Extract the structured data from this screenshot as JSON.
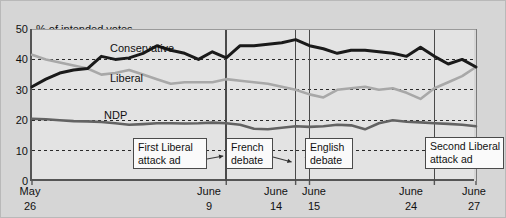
{
  "figure": {
    "axis_title": "% of intended votes",
    "background_color": "#d6d6d6",
    "plot_background_color": "#e3e3e3",
    "axis_color": "#555555"
  },
  "y_axis": {
    "ticks": [
      "50",
      "40",
      "30",
      "20",
      "10",
      "0"
    ],
    "min": 0,
    "max": 50,
    "gridline_style": "dashed"
  },
  "x_axis": {
    "ticks": [
      {
        "month": "May",
        "day": "26"
      },
      {
        "month": "June",
        "day": "9"
      },
      {
        "month": "June",
        "day": "14"
      },
      {
        "month": "June",
        "day": "15"
      },
      {
        "month": "June",
        "day": "24"
      },
      {
        "month": "June",
        "day": "27"
      }
    ]
  },
  "series_labels": {
    "conservative": "Conservative",
    "liberal": "Liberal",
    "ndp": "NDP"
  },
  "annotations": [
    {
      "id": "first-liberal-attack-ad",
      "line1": "First Liberal",
      "line2": "attack ad"
    },
    {
      "id": "french-debate",
      "line1": "French",
      "line2": "debate"
    },
    {
      "id": "english-debate",
      "line1": "English",
      "line2": "debate"
    },
    {
      "id": "second-liberal-attack-ad",
      "line1": "Second Liberal",
      "line2": "attack ad"
    }
  ],
  "chart_data": {
    "type": "line",
    "title": "% of intended votes",
    "xlabel": "",
    "ylabel": "% of intended votes",
    "ylim": [
      0,
      50
    ],
    "yticks": [
      0,
      10,
      20,
      30,
      40,
      50
    ],
    "grid": "horizontal-dashed",
    "legend": "inline-series-labels",
    "x_tick_labels": [
      "May 26",
      "June 9",
      "June 14",
      "June 15",
      "June 24",
      "June 27"
    ],
    "x_tick_days": [
      0,
      14,
      19,
      20,
      29,
      32
    ],
    "x_event_lines": [
      {
        "label": "First Liberal attack ad",
        "day": 14,
        "x_tick": "June 9"
      },
      {
        "label": "French debate",
        "day": 19,
        "x_tick": "June 14"
      },
      {
        "label": "English debate",
        "day": 20,
        "x_tick": "June 15"
      },
      {
        "label": "Second Liberal attack ad",
        "day": 29,
        "x_tick": "June 24"
      }
    ],
    "x": [
      0,
      1,
      2,
      3,
      4,
      5,
      6,
      7,
      8,
      9,
      10,
      11,
      12,
      13,
      14,
      15,
      16,
      17,
      18,
      19,
      20,
      21,
      22,
      23,
      24,
      25,
      26,
      27,
      28,
      29,
      30,
      31,
      32
    ],
    "series": [
      {
        "name": "Conservative",
        "color": "#1a1a1a",
        "width": 3,
        "values": [
          31.0,
          33.5,
          35.5,
          36.5,
          37.0,
          41.0,
          40.0,
          40.5,
          42.0,
          44.5,
          43.0,
          42.0,
          40.0,
          42.5,
          40.5,
          44.5,
          44.5,
          45.0,
          45.5,
          46.5,
          44.5,
          43.5,
          42.0,
          43.0,
          43.0,
          42.5,
          42.0,
          41.0,
          44.0,
          41.0,
          38.5,
          40.0,
          37.5
        ]
      },
      {
        "name": "Liberal",
        "color": "#a8a8a8",
        "width": 2.6,
        "values": [
          41.5,
          40.0,
          39.0,
          38.0,
          37.0,
          35.0,
          35.5,
          36.5,
          35.0,
          33.5,
          32.0,
          32.5,
          32.5,
          32.5,
          33.5,
          33.0,
          32.5,
          32.0,
          31.0,
          30.0,
          28.5,
          27.5,
          30.0,
          30.5,
          31.0,
          30.0,
          30.5,
          29.0,
          27.0,
          30.5,
          32.5,
          34.5,
          37.5
        ]
      },
      {
        "name": "NDP",
        "color": "#636363",
        "width": 2.6,
        "values": [
          20.5,
          20.3,
          20.0,
          19.7,
          19.6,
          19.4,
          19.0,
          18.5,
          18.7,
          19.0,
          19.0,
          18.9,
          19.0,
          19.2,
          19.0,
          18.5,
          17.2,
          17.0,
          17.5,
          18.0,
          17.8,
          18.0,
          18.5,
          18.3,
          17.0,
          19.0,
          20.0,
          19.5,
          19.3,
          19.0,
          18.8,
          18.5,
          18.0
        ]
      }
    ]
  }
}
